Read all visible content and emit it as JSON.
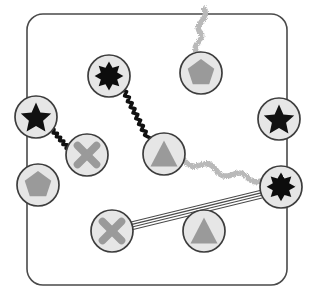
{
  "figure": {
    "width": 314,
    "height": 303,
    "background": "#ffffff"
  },
  "frame": {
    "name": "rounded-rectangle-border",
    "x": 27,
    "y": 14,
    "width": 260,
    "height": 271,
    "radius": 16,
    "stroke": "#4a4a4a",
    "stroke_width": 1.6,
    "fill": "none"
  },
  "palette": {
    "node_fill": "#e6e6e6",
    "node_stroke": "#3d3d3d",
    "glyph_gray": "#9a9a9a",
    "glyph_black": "#111111",
    "edge_black": "#111111",
    "edge_speckle": "#b5b5b5",
    "edge_line": "#4a4a4a"
  },
  "nodes": [
    {
      "id": "n1",
      "shape": "star8",
      "fill": "black",
      "cx": 109,
      "cy": 76,
      "r": 21,
      "label": "8-point-star-node-top"
    },
    {
      "id": "n2",
      "shape": "pentagon",
      "fill": "gray",
      "cx": 201,
      "cy": 73,
      "r": 21,
      "label": "pentagon-node-top"
    },
    {
      "id": "n3",
      "shape": "star5",
      "fill": "black",
      "cx": 36,
      "cy": 117,
      "r": 21,
      "label": "5-point-star-node-left"
    },
    {
      "id": "n4",
      "shape": "star5",
      "fill": "black",
      "cx": 279,
      "cy": 119,
      "r": 21,
      "label": "5-point-star-node-right"
    },
    {
      "id": "n5",
      "shape": "cross",
      "fill": "gray",
      "cx": 87,
      "cy": 155,
      "r": 21,
      "label": "cross-node-left"
    },
    {
      "id": "n6",
      "shape": "triangle",
      "fill": "gray",
      "cx": 164,
      "cy": 154,
      "r": 21,
      "label": "triangle-node-center"
    },
    {
      "id": "n7",
      "shape": "pentagon",
      "fill": "gray",
      "cx": 38,
      "cy": 185,
      "r": 21,
      "label": "pentagon-node-left"
    },
    {
      "id": "n8",
      "shape": "star8",
      "fill": "black",
      "cx": 281,
      "cy": 187,
      "r": 21,
      "label": "8-point-star-node-right"
    },
    {
      "id": "n9",
      "shape": "cross",
      "fill": "gray",
      "cx": 112,
      "cy": 231,
      "r": 21,
      "label": "cross-node-bottom"
    },
    {
      "id": "n10",
      "shape": "triangle",
      "fill": "gray",
      "cx": 204,
      "cy": 231,
      "r": 21,
      "label": "triangle-node-bottom"
    }
  ],
  "edges": [
    {
      "id": "e1",
      "style": "zigzag",
      "from": "n3",
      "to": "n5",
      "x1": 50,
      "y1": 128,
      "x2": 73,
      "y2": 146,
      "label": "zigzag-edge-star-to-cross"
    },
    {
      "id": "e2",
      "style": "zigzag",
      "from": "n1",
      "to": "n6",
      "x1": 122,
      "y1": 90,
      "x2": 152,
      "y2": 139,
      "label": "zigzag-edge-star-to-triangle"
    },
    {
      "id": "e3",
      "style": "speckled",
      "from": "n6",
      "to": "n8",
      "x1": 184,
      "y1": 160,
      "x2": 262,
      "y2": 181,
      "label": "speckled-edge-triangle-to-star"
    },
    {
      "id": "e4",
      "style": "speckled",
      "from": "n2",
      "to": "open",
      "x1": 197,
      "y1": 52,
      "x2": 205,
      "y2": 8,
      "label": "speckled-edge-pentagon-upward"
    },
    {
      "id": "e5",
      "style": "multiline",
      "from": "n9",
      "to": "n8",
      "x1": 131,
      "y1": 226,
      "x2": 262,
      "y2": 194,
      "label": "four-line-edge-cross-to-star"
    }
  ],
  "legend": {
    "shapes": [
      "star8",
      "pentagon",
      "star5",
      "cross",
      "triangle"
    ],
    "edge_styles": [
      "zigzag",
      "speckled",
      "multiline"
    ]
  }
}
